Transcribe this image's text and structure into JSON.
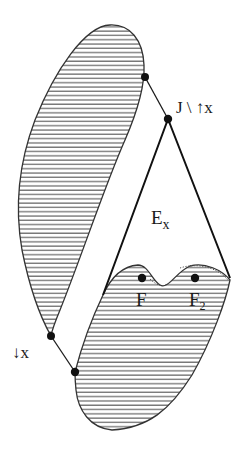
{
  "diagram": {
    "labels": {
      "upper_point": "J \\ ↑x",
      "lower_point": "↓x",
      "region": "E",
      "region_sub": "x",
      "point_f": "F",
      "point_f2": "F",
      "point_f2_sub": "2"
    },
    "colors": {
      "stroke": "#1a1a1a",
      "hatch": "#555555",
      "background": "#ffffff"
    },
    "regions": [
      {
        "name": "upper-hatched-region",
        "fill": "horizontal-hatch"
      },
      {
        "name": "lower-hatched-region",
        "fill": "horizontal-hatch"
      },
      {
        "name": "E_x-region",
        "fill": "none"
      }
    ],
    "points": [
      {
        "name": "upper-junction-dot",
        "x": 145,
        "y": 77
      },
      {
        "name": "J-dot",
        "x": 168,
        "y": 119
      },
      {
        "name": "F-dot",
        "x": 142,
        "y": 278
      },
      {
        "name": "F2-dot",
        "x": 195,
        "y": 278
      },
      {
        "name": "down-x-dot",
        "x": 51,
        "y": 336
      },
      {
        "name": "lower-junction-dot",
        "x": 75,
        "y": 372
      }
    ]
  }
}
